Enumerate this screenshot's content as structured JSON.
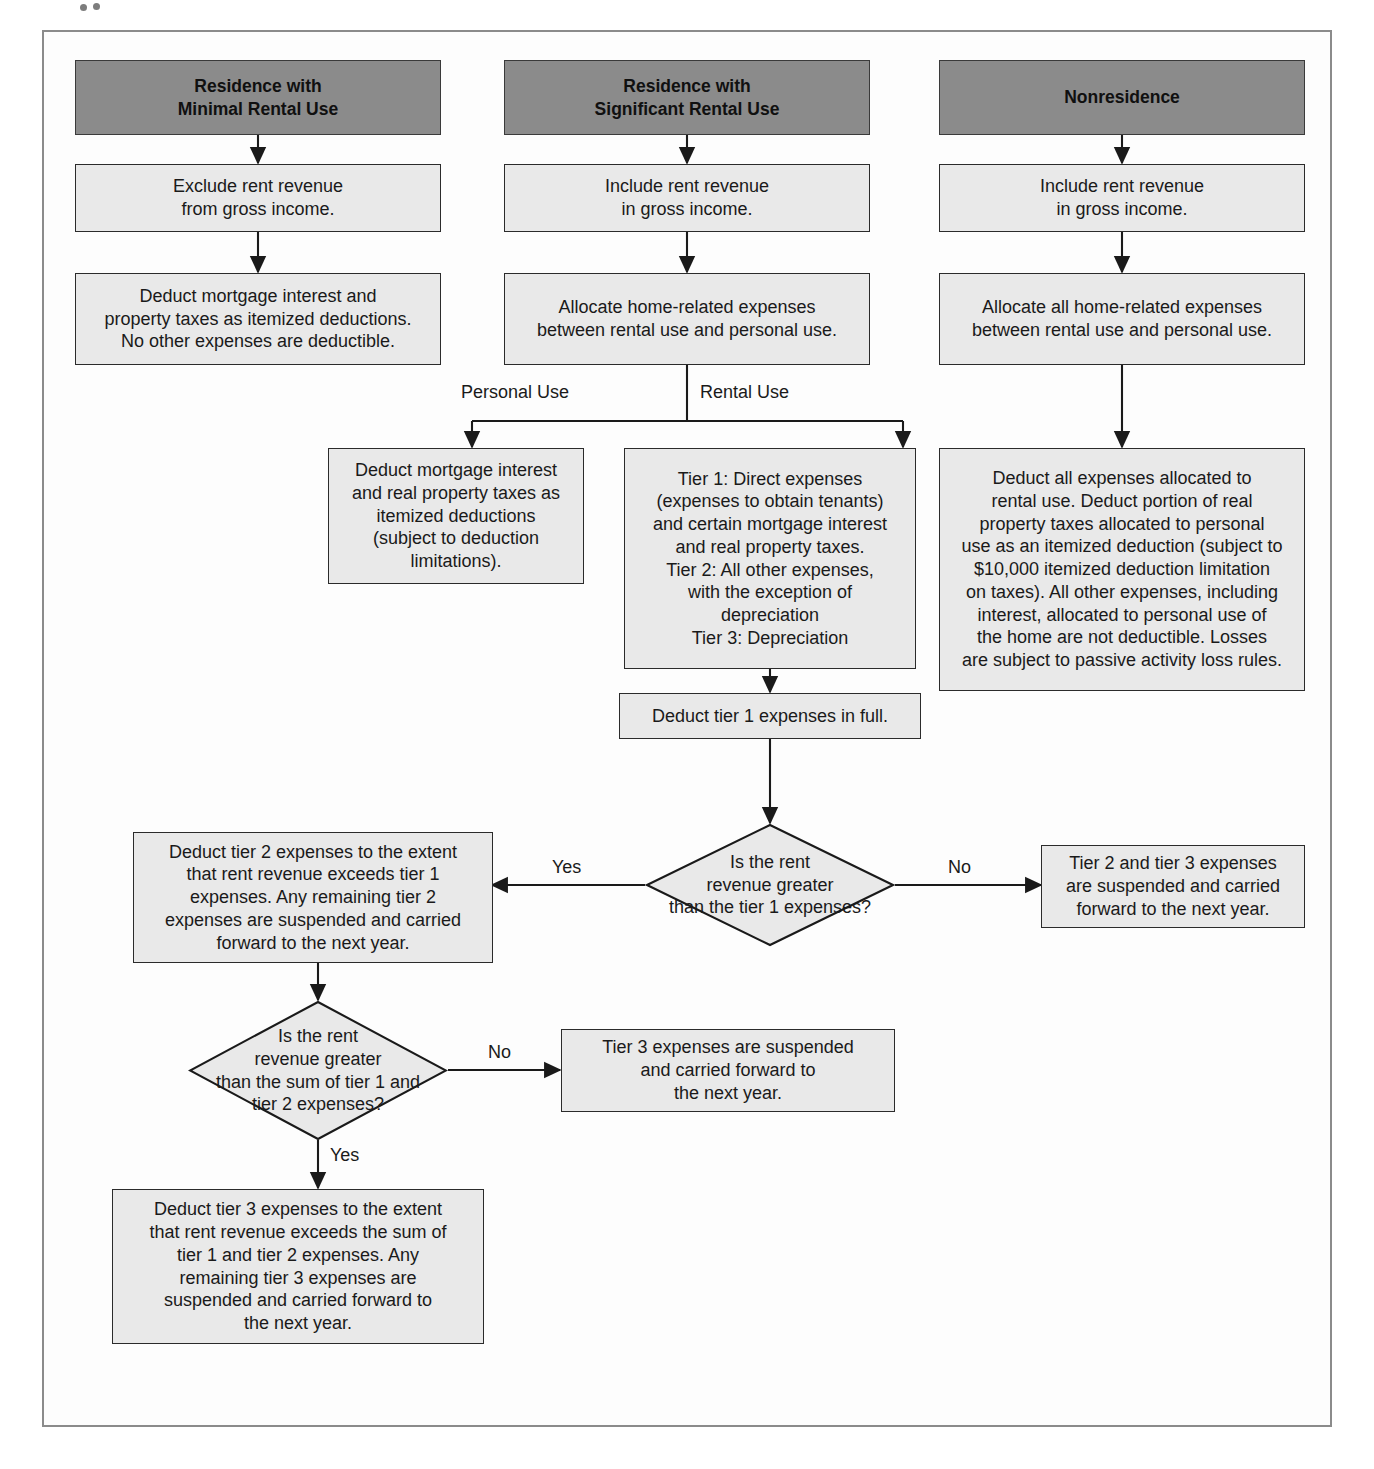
{
  "diagram": {
    "type": "flowchart",
    "colors": {
      "header_fill": "#8b8b8b",
      "node_fill": "#e9e9e9",
      "stroke": "#2b2b2b",
      "frame": "#8b8b8b",
      "background": "#fdfdfd",
      "text": "#1a1a1a"
    },
    "columns": [
      {
        "key": "minimal",
        "header": "Residence with\nMinimal Rental Use"
      },
      {
        "key": "significant",
        "header": "Residence with\nSignificant Rental Use"
      },
      {
        "key": "nonresidence",
        "header": "Nonresidence"
      }
    ],
    "nodes": {
      "h1": "Residence with\nMinimal Rental Use",
      "h2": "Residence with\nSignificant Rental Use",
      "h3": "Nonresidence",
      "c1b1": "Exclude rent revenue\nfrom gross income.",
      "c1b2": "Deduct mortgage interest and\nproperty taxes as itemized deductions.\nNo other expenses are deductible.",
      "c2b1": "Include rent revenue\nin gross income.",
      "c2b2": "Allocate home-related expenses\nbetween rental use and personal use.",
      "c2_personal": "Deduct mortgage interest\nand real property taxes as\nitemized deductions\n(subject to deduction\nlimitations).",
      "c2_rental": "Tier 1: Direct expenses\n(expenses to obtain tenants)\nand certain mortgage interest\nand real property taxes.\nTier 2: All other expenses,\nwith the exception of\ndepreciation\nTier 3: Depreciation",
      "c2_tier1full": "Deduct tier 1 expenses in full.",
      "c3b1": "Include rent revenue\nin gross income.",
      "c3b2": "Allocate all home-related expenses\nbetween rental use and personal use.",
      "c3b3": "Deduct all expenses allocated to\nrental use. Deduct portion of real\nproperty taxes allocated to personal\nuse as an itemized deduction (subject to\n$10,000 itemized deduction limitation\non taxes). All other expenses, including\ninterest, allocated to personal use of\nthe home are not deductible. Losses\nare subject to passive activity loss rules.",
      "d1": "Is the rent\nrevenue greater\nthan the tier 1 expenses?",
      "d1_yes_box": "Deduct tier 2 expenses to the extent\nthat rent revenue exceeds tier 1\nexpenses. Any remaining tier 2\nexpenses are suspended and carried\nforward to the next year.",
      "d1_no_box": "Tier 2 and tier 3 expenses\nare suspended and carried\nforward to the next year.",
      "d2": "Is the rent\nrevenue greater\nthan the sum of tier 1 and\ntier 2 expenses?",
      "d2_no_box": "Tier 3 expenses are suspended\nand carried forward to\nthe next year.",
      "d2_yes_box": "Deduct tier 3 expenses to the extent\nthat rent revenue exceeds the sum of\ntier 1 and tier 2 expenses. Any\nremaining tier 3 expenses are\nsuspended and carried forward to\nthe next year."
    },
    "edge_labels": {
      "personal_use": "Personal Use",
      "rental_use": "Rental Use",
      "d1_yes": "Yes",
      "d1_no": "No",
      "d2_no": "No",
      "d2_yes": "Yes"
    }
  }
}
